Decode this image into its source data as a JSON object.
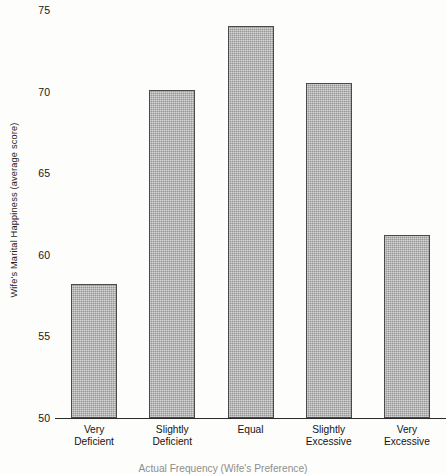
{
  "chart_data": {
    "type": "bar",
    "title": "",
    "categories": [
      "Very Deficient",
      "Slightly Deficient",
      "Equal",
      "Slightly Excessive",
      "Very Excessive"
    ],
    "category_lines": [
      [
        "Very",
        "Deficient"
      ],
      [
        "Slightly",
        "Deficient"
      ],
      [
        "Equal",
        ""
      ],
      [
        "Slightly",
        "Excessive"
      ],
      [
        "Very",
        "Excessive"
      ]
    ],
    "values": [
      58.2,
      70.1,
      74.0,
      70.5,
      61.2
    ],
    "xlabel": "Actual Frequency (Wife's Preference)",
    "ylabel": "Wife's Marital Happiness (average score)",
    "ylim": [
      50,
      75
    ],
    "yticks": [
      75,
      70,
      65,
      60,
      55,
      50
    ],
    "grid": false,
    "legend": false,
    "bar_color": "#a9a9a9",
    "bar_edge_color": "#4a4a4a",
    "axis_color": "#2a2a2a",
    "background_color": "#fdfdfb"
  }
}
